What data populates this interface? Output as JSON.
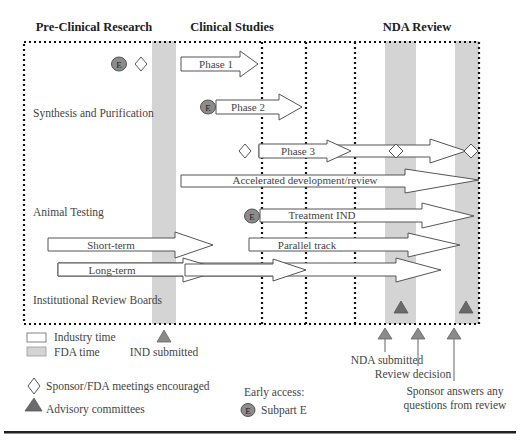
{
  "headers": {
    "preclinical": "Pre-Clinical Research",
    "clinical": "Clinical Studies",
    "nda": "NDA Review"
  },
  "rows": {
    "synthesis": "Synthesis and Purification",
    "animal": "Animal Testing",
    "irb": "Institutional Review Boards"
  },
  "arrows": {
    "phase1": "Phase 1",
    "phase2": "Phase 2",
    "phase3": "Phase 3",
    "accelerated": "Accelerated development/review",
    "treatment_ind": "Treatment IND",
    "parallel": "Parallel track",
    "short_term": "Short-term",
    "long_term": "Long-term"
  },
  "markers": {
    "e_symbol": "E"
  },
  "milestones": {
    "ind_submitted": "IND submitted",
    "nda_submitted": "NDA submitted",
    "review_decision": "Review decision",
    "sponsor_answers_line1": "Sponsor answers any",
    "sponsor_answers_line2": "questions from review"
  },
  "legend": {
    "industry_time": "Industry time",
    "fda_time": "FDA time",
    "meetings": "Sponsor/FDA meetings encouraged",
    "advisory": "Advisory committees",
    "early_access_title": "Early access:",
    "subpart_e": "Subpart E"
  },
  "colors": {
    "fda_band": "#d4d4d4",
    "triangle": "#6a6a6a",
    "e_circle": "#8c8c8c"
  }
}
